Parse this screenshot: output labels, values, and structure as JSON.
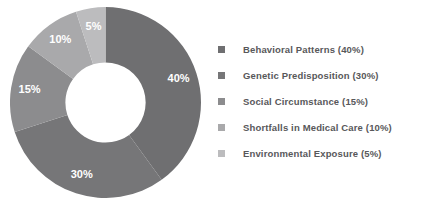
{
  "chart_data": {
    "type": "pie",
    "variant": "donut",
    "title": "",
    "xlabel": "",
    "ylabel": "",
    "categories": [
      "Behavioral Patterns",
      "Genetic Predisposition",
      "Social Circumstance",
      "Shortfalls in Medical Care",
      "Environmental Exposure"
    ],
    "values": [
      40,
      30,
      15,
      10,
      5
    ],
    "value_unit": "%",
    "data_labels": [
      "40%",
      "30%",
      "15%",
      "10%",
      "5%"
    ],
    "colors": [
      "#6f6f71",
      "#767678",
      "#8c8c8e",
      "#a9a9ab",
      "#bcbcbe"
    ],
    "start_angle_deg": 0,
    "direction": "clockwise",
    "hole_ratio": 0.42,
    "grid": false,
    "legend_position": "right",
    "legend_entries": [
      "Behavioral Patterns (40%)",
      "Genetic Predisposition (30%)",
      "Social Circumstance (15%)",
      "Shortfalls in Medical Care (10%)",
      "Environmental Exposure (5%)"
    ],
    "label_text_color": "#ffffff",
    "legend_text_color": "#58585a",
    "background_color": "#ffffff"
  },
  "legend": {
    "items": [
      {
        "label": "Behavioral Patterns (40%)",
        "color": "#6f6f71"
      },
      {
        "label": "Genetic Predisposition (30%)",
        "color": "#767678"
      },
      {
        "label": "Social Circumstance (15%)",
        "color": "#8c8c8e"
      },
      {
        "label": "Shortfalls in Medical Care (10%)",
        "color": "#a9a9ab"
      },
      {
        "label": "Environmental Exposure (5%)",
        "color": "#bcbcbe"
      }
    ]
  }
}
